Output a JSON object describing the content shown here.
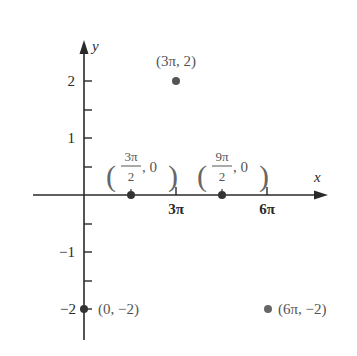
{
  "diagram": {
    "axes": {
      "x_label": "x",
      "y_label": "y",
      "x_ticks": [
        {
          "label": "3π",
          "value": "3pi"
        },
        {
          "label": "6π",
          "value": "6pi"
        }
      ],
      "y_ticks": [
        {
          "label": "2",
          "value": 2
        },
        {
          "label": "1",
          "value": 1
        },
        {
          "label": "−1",
          "value": -1
        },
        {
          "label": "−2",
          "value": -2
        }
      ]
    },
    "points": [
      {
        "label": "(3π, 2)",
        "x": "3pi",
        "y": 2
      },
      {
        "label_num": "3π",
        "label_den": "2",
        "label_rest": ", 0",
        "x": "3pi/2",
        "y": 0
      },
      {
        "label_num": "9π",
        "label_den": "2",
        "label_rest": ", 0",
        "x": "9pi/2",
        "y": 0
      },
      {
        "label": "(0, −2)",
        "x": 0,
        "y": -2
      },
      {
        "label": "(6π, −2)",
        "x": "6pi",
        "y": -2
      }
    ],
    "colors": {
      "axis": "#2a2a2a",
      "point": "#555555",
      "point_label": "#555555"
    }
  }
}
